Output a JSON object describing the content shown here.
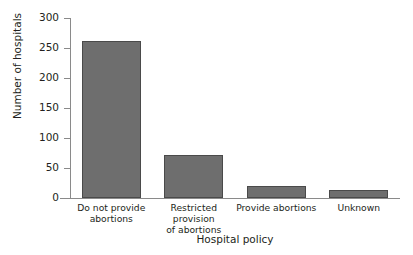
{
  "figure": {
    "width": 413,
    "height": 255,
    "background": "#ffffff",
    "title_partial": "",
    "bar_color": "#6e6e6e",
    "bar_edge_color": "#4a4a4a",
    "axis_color": "#8a8a8a",
    "text_color": "#231f20"
  },
  "chart_data": {
    "type": "bar",
    "title": "",
    "xlabel": "Hospital policy",
    "ylabel": "Number of hospitals",
    "categories": [
      "Do not provide abortions",
      "Restricted provision of abortions",
      "Provide abortions",
      "Unknown"
    ],
    "category_lines": [
      [
        "Do not provide",
        "abortions"
      ],
      [
        "Restricted provision",
        "of abortions"
      ],
      [
        "Provide abortions"
      ],
      [
        "Unknown"
      ]
    ],
    "values": [
      262,
      72,
      20,
      13
    ],
    "ylim": [
      0,
      300
    ],
    "yticks": [
      0,
      50,
      100,
      150,
      200,
      250,
      300
    ],
    "ytick_labels": [
      "0",
      "50",
      "100",
      "150",
      "200",
      "250",
      "300"
    ],
    "grid": false,
    "legend": null
  }
}
